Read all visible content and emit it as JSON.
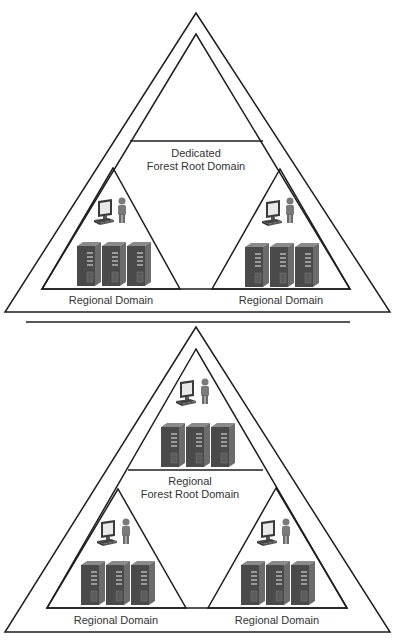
{
  "diagrams": [
    {
      "name": "dedicated-forest-root",
      "root_label_line1": "Dedicated",
      "root_label_line2": "Forest Root Domain",
      "root_has_resources": false,
      "child_domains": [
        {
          "label": "Regional Domain"
        },
        {
          "label": "Regional Domain"
        }
      ]
    },
    {
      "name": "regional-forest-root",
      "root_label_line1": "Regional",
      "root_label_line2": "Forest Root Domain",
      "root_has_resources": true,
      "child_domains": [
        {
          "label": "Regional Domain"
        },
        {
          "label": "Regional Domain"
        }
      ]
    }
  ],
  "icons": {
    "workstation": "workstation-icon",
    "user": "user-icon",
    "server": "server-icon"
  },
  "colors": {
    "line": "#1e1e1e",
    "text": "#333333",
    "server_front": "#4a4a4a",
    "server_side": "#6c6c6c",
    "server_top": "#8a8a8a",
    "screen": "#e8e8e8",
    "person": "#7a7a7a"
  }
}
